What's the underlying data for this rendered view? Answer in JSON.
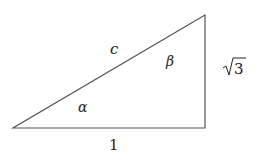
{
  "diagram": {
    "type": "right-triangle",
    "vertices": {
      "A": [
        13,
        128
      ],
      "B": [
        205,
        128
      ],
      "C": [
        205,
        15
      ]
    },
    "stroke_color": "#555555",
    "labels": {
      "hypotenuse": "c",
      "base": "1",
      "height_sqrt": "3",
      "angle_alpha": "α",
      "angle_beta": "β"
    }
  }
}
